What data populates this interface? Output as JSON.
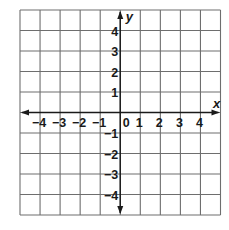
{
  "diagram": {
    "type": "coordinate-plane",
    "x_axis": {
      "name": "x",
      "min": -5,
      "max": 5,
      "tick_labels": [
        "−4",
        "−3",
        "−2",
        "−1",
        "0",
        "1",
        "2",
        "3",
        "4"
      ],
      "tick_values": [
        -4,
        -3,
        -2,
        -1,
        0,
        1,
        2,
        3,
        4
      ]
    },
    "y_axis": {
      "name": "y",
      "min": -5,
      "max": 5,
      "tick_labels_positive": [
        "4",
        "3",
        "2",
        "1"
      ],
      "tick_values_positive": [
        4,
        3,
        2,
        1
      ],
      "tick_labels_negative": [
        "−1",
        "−2",
        "−3",
        "−4"
      ],
      "tick_values_negative": [
        -1,
        -2,
        -3,
        -4
      ]
    },
    "grid": {
      "columns": 10,
      "rows": 10,
      "left": 20,
      "top": 10,
      "cell_width": 20.05,
      "cell_height": 20.5
    },
    "colors": {
      "grid": "#6e6e6e",
      "axis": "#1a1a1a",
      "background": "#ffffff"
    }
  }
}
